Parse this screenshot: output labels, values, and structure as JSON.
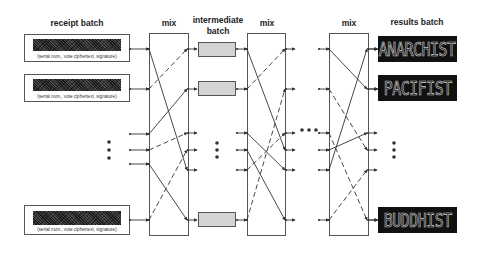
{
  "headers": {
    "receipt_batch": "receipt batch",
    "mix_1": "mix",
    "intermediate_line1": "intermediate",
    "intermediate_line2": "batch",
    "mix_2": "mix",
    "mix_3": "mix",
    "results_batch": "results batch"
  },
  "receipts": [
    {
      "caption": "(serial num., vote ciphertext, signature)"
    },
    {
      "caption": "(serial num., vote ciphertext, signature)"
    },
    {
      "caption": "(serial num., vote ciphertext, signature)"
    }
  ],
  "results": [
    {
      "text": "ANARCHIST"
    },
    {
      "text": "PACIFIST"
    },
    {
      "text": "BUDDHIST"
    }
  ],
  "colors": {
    "line": "#333333",
    "box_border": "#555555",
    "intermediate_fill": "#d4d4d4",
    "result_bg": "#111111",
    "result_text": "#cfcfcf"
  },
  "rows_y": [
    49,
    89,
    133,
    150,
    170,
    220
  ],
  "mix_stages": [
    {
      "name": "mix-1",
      "left_x": 149,
      "right_x": 188,
      "left_rows_y": [
        49,
        89,
        134,
        150,
        164,
        220
      ],
      "connections": [
        {
          "from_y": 49,
          "to_y": 170,
          "style": "solid"
        },
        {
          "from_y": 89,
          "to_y": 49,
          "style": "dashed"
        },
        {
          "from_y": 134,
          "to_y": 89,
          "style": "solid"
        },
        {
          "from_y": 150,
          "to_y": 133,
          "style": "dashed"
        },
        {
          "from_y": 164,
          "to_y": 220,
          "style": "solid"
        },
        {
          "from_y": 220,
          "to_y": 150,
          "style": "dashed"
        }
      ]
    },
    {
      "name": "mix-2",
      "left_x": 247,
      "right_x": 286,
      "left_rows_y": [
        49,
        89,
        133,
        150,
        170,
        220
      ],
      "connections": [
        {
          "from_y": 49,
          "to_y": 150,
          "style": "solid"
        },
        {
          "from_y": 89,
          "to_y": 49,
          "style": "dashed"
        },
        {
          "from_y": 133,
          "to_y": 170,
          "style": "solid"
        },
        {
          "from_y": 150,
          "to_y": 220,
          "style": "solid"
        },
        {
          "from_y": 170,
          "to_y": 133,
          "style": "dashed"
        },
        {
          "from_y": 220,
          "to_y": 89,
          "style": "dashed"
        }
      ]
    },
    {
      "name": "mix-3",
      "left_x": 329,
      "right_x": 368,
      "left_rows_y": [
        49,
        89,
        133,
        150,
        170,
        220
      ],
      "connections": [
        {
          "from_y": 49,
          "to_y": 89,
          "style": "solid"
        },
        {
          "from_y": 89,
          "to_y": 150,
          "style": "dashed"
        },
        {
          "from_y": 133,
          "to_y": 220,
          "style": "dashed"
        },
        {
          "from_y": 150,
          "to_y": 133,
          "style": "solid"
        },
        {
          "from_y": 170,
          "to_y": 49,
          "style": "solid"
        },
        {
          "from_y": 220,
          "to_y": 170,
          "style": "dashed"
        }
      ]
    }
  ],
  "ellipses": {
    "vertical": [
      {
        "x": 109,
        "y": [
          142,
          150,
          158
        ]
      },
      {
        "x": 217,
        "y": [
          143,
          150,
          157
        ]
      },
      {
        "x": 394,
        "y": [
          143,
          150,
          157
        ]
      }
    ],
    "horizontal": {
      "y": 130,
      "x": [
        302,
        309,
        316
      ]
    }
  }
}
